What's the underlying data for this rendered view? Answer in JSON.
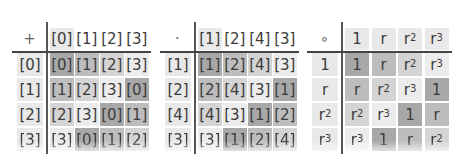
{
  "tables": [
    {
      "name": "addition-mod-4",
      "operator": "+",
      "column_headers": [
        "[0]",
        "[1]",
        "[2]",
        "[3]"
      ],
      "row_headers": [
        "[0]",
        "[1]",
        "[2]",
        "[3]"
      ],
      "cells": [
        [
          "[0]",
          "[1]",
          "[2]",
          "[3]"
        ],
        [
          "[1]",
          "[2]",
          "[3]",
          "[0]"
        ],
        [
          "[2]",
          "[3]",
          "[0]",
          "[1]"
        ],
        [
          "[3]",
          "[0]",
          "[1]",
          "[2]"
        ]
      ]
    },
    {
      "name": "multiplication-mod-5",
      "operator": "·",
      "column_headers": [
        "[1]",
        "[2]",
        "[4]",
        "[3]"
      ],
      "row_headers": [
        "[1]",
        "[2]",
        "[4]",
        "[3]"
      ],
      "cells": [
        [
          "[1]",
          "[2]",
          "[4]",
          "[3]"
        ],
        [
          "[2]",
          "[4]",
          "[3]",
          "[1]"
        ],
        [
          "[4]",
          "[3]",
          "[1]",
          "[2]"
        ],
        [
          "[3]",
          "[1]",
          "[2]",
          "[4]"
        ]
      ]
    },
    {
      "name": "rotation-composition",
      "operator": "∘",
      "column_headers": [
        "1",
        "r",
        "r²",
        "r³"
      ],
      "row_headers": [
        "1",
        "r",
        "r²",
        "r³"
      ],
      "cells": [
        [
          "1",
          "r",
          "r²",
          "r³"
        ],
        [
          "r",
          "r²",
          "r³",
          "1"
        ],
        [
          "r²",
          "r³",
          "1",
          "r"
        ],
        [
          "r³",
          "1",
          "r",
          "r²"
        ]
      ]
    }
  ],
  "shade_colors": {
    "element_0": "#a8a8a8",
    "element_1": "#bdbdbd",
    "element_2": "#d4d4d4",
    "element_3": "#ececec"
  }
}
